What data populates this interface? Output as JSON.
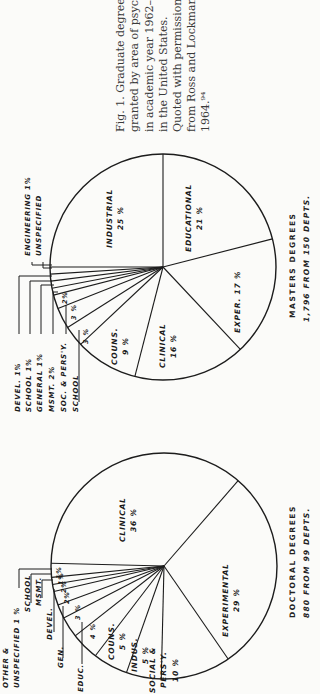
{
  "caption": {
    "lines": [
      "Fig. 1. Graduate degrees",
      "granted by area of psycho",
      "in academic year 1962–63",
      "in the United States.",
      "Quoted with permission",
      "from Ross and Lockman,",
      "1964.⁹⁴"
    ]
  },
  "masters": {
    "title": "MASTERS DEGREES",
    "subtitle": "1,796 FROM 150 DEPTS."
  },
  "doctoral": {
    "title": "DOCTORAL DEGREES",
    "subtitle": "880 FROM 99 DEPTS."
  },
  "chart_data": [
    {
      "type": "pie",
      "title": "MASTERS DEGREES",
      "subtitle": "1,796 FROM 150 DEPTS.",
      "orientation": "rotated -90deg (text reads bottom-to-top)",
      "center": [
        163,
        267
      ],
      "radius": 113,
      "start_angle_deg": -90,
      "slices": [
        {
          "label": "EDUCATIONAL",
          "value": 21,
          "display": "21 %",
          "inside": true
        },
        {
          "label": "EXPER.",
          "value": 17,
          "display": "17 %",
          "inside": true
        },
        {
          "label": "CLINICAL",
          "value": 16,
          "display": "16 %",
          "inside": true
        },
        {
          "label": "COUNS.",
          "value": 9,
          "display": "9 %",
          "inside": true
        },
        {
          "label": "SCHOOL",
          "value": 3,
          "display": "3 %",
          "inside": false
        },
        {
          "label": "SOC. & PERS'Y.",
          "value": 3,
          "display": "3 %",
          "inside": false
        },
        {
          "label": "MSMT.",
          "value": 2,
          "display": "2 %",
          "inside": false
        },
        {
          "label": "GENERAL",
          "value": 1,
          "display": "1 %",
          "inside": false
        },
        {
          "label": "SCHOOL",
          "value": 1,
          "display": "1 %",
          "inside": false
        },
        {
          "label": "DEVEL.",
          "value": 1,
          "display": "1 %",
          "inside": false
        },
        {
          "label": "ENGINEERING / UNSPECIFIED",
          "value": 1,
          "display": "1 %",
          "inside": false
        },
        {
          "label": "INDUSTRIAL",
          "value": 25,
          "display": "25 %",
          "inside": true
        }
      ],
      "outside_labels": [
        {
          "text": "ENGINEERING   1%",
          "x": 29,
          "y": 256
        },
        {
          "text": "UNSPECIFIED",
          "x": 40,
          "y": 256
        },
        {
          "text": "DEVEL.     1%",
          "x": 19,
          "y": 412
        },
        {
          "text": "SCHOOL     1%",
          "x": 30,
          "y": 412
        },
        {
          "text": "GENERAL    1%",
          "x": 41,
          "y": 412
        },
        {
          "text": "MSMT.      2%",
          "x": 53,
          "y": 412
        },
        {
          "text": "SOC. & PERS'Y.",
          "x": 65,
          "y": 412
        },
        {
          "text": "SCHOOL",
          "x": 77,
          "y": 412
        }
      ],
      "inner_labels": [
        {
          "text": "INDUSTRIAL",
          "sub": "25 %",
          "x": 117,
          "y": 218
        },
        {
          "text": "EDUCATIONAL",
          "sub": "21 %",
          "x": 196,
          "y": 218
        },
        {
          "text": "EXPER.  17 %",
          "sub": "",
          "x": 240,
          "y": 302
        },
        {
          "text": "CLINICAL",
          "sub": "16 %",
          "x": 170,
          "y": 346
        },
        {
          "text": "COUNS.",
          "sub": "9 %",
          "x": 122,
          "y": 346
        },
        {
          "text": "3 %",
          "sub": "",
          "x": 88,
          "y": 336
        },
        {
          "text": "3 %",
          "sub": "",
          "x": 76,
          "y": 312
        },
        {
          "text": "2%",
          "sub": "",
          "x": 67,
          "y": 298
        }
      ]
    },
    {
      "type": "pie",
      "title": "DOCTORAL DEGREES",
      "subtitle": "880 FROM 99 DEPTS.",
      "orientation": "rotated -90deg (text reads bottom-to-top)",
      "center": [
        164,
        566
      ],
      "radius": 113,
      "start_angle_deg": -49,
      "slices": [
        {
          "label": "EXPERIMENTAL",
          "value": 29,
          "display": "29 %",
          "inside": true
        },
        {
          "label": "SOCIAL & PERS'Y.",
          "value": 10,
          "display": "10 %",
          "inside": true
        },
        {
          "label": "INDUS.",
          "value": 5,
          "display": "5 %",
          "inside": true
        },
        {
          "label": "COUNS.",
          "value": 5,
          "display": "5 %",
          "inside": true
        },
        {
          "label": "EDUC.",
          "value": 4,
          "display": "4 %",
          "inside": false
        },
        {
          "label": "GEN.",
          "value": 3,
          "display": "3 %",
          "inside": false
        },
        {
          "label": "DEVEL.",
          "value": 2,
          "display": "2 %",
          "inside": false
        },
        {
          "label": "MSMT.",
          "value": 2,
          "display": "2 %",
          "inside": false
        },
        {
          "label": "SCHOOL",
          "value": 1,
          "display": "1 %",
          "inside": false
        },
        {
          "label": "OTHER & UNSPECIFIED",
          "value": 1,
          "display": "1 %",
          "inside": false
        },
        {
          "label": "",
          "value": 2,
          "display": "",
          "inside": false
        },
        {
          "label": "CLINICAL",
          "value": 36,
          "display": "36 %",
          "inside": true
        }
      ],
      "outside_labels": [
        {
          "text": "OTHER &",
          "x": 7,
          "y": 688
        },
        {
          "text": "UNSPECIFIED  1 %",
          "x": 18,
          "y": 688
        },
        {
          "text": "SCHOOL",
          "x": 29,
          "y": 612
        },
        {
          "text": "MSMT.",
          "x": 40,
          "y": 606
        },
        {
          "text": "DEVEL.",
          "x": 51,
          "y": 640
        },
        {
          "text": "GEN.",
          "x": 62,
          "y": 668
        },
        {
          "text": "EDUC.",
          "x": 82,
          "y": 692
        }
      ],
      "inner_labels": [
        {
          "text": "CLINICAL",
          "sub": "36 %",
          "x": 130,
          "y": 520
        },
        {
          "text": "EXPERIMENTAL",
          "sub": "29 %",
          "x": 233,
          "y": 600
        },
        {
          "text": "SOCIAL &",
          "sub": "PERS'Y.",
          "sub2": "10 %",
          "x": 166,
          "y": 670
        },
        {
          "text": "INDUS.",
          "sub": "5 %",
          "x": 142,
          "y": 655
        },
        {
          "text": "COUNS.",
          "sub": "5 %",
          "x": 119,
          "y": 641
        },
        {
          "text": "4 %",
          "sub": "",
          "x": 95,
          "y": 631
        },
        {
          "text": "3 %",
          "sub": "",
          "x": 80,
          "y": 612
        },
        {
          "text": "2%",
          "sub": "",
          "x": 69,
          "y": 598
        },
        {
          "text": "2%",
          "sub": "",
          "x": 66,
          "y": 587
        },
        {
          "text": "1%",
          "sub": "",
          "x": 63,
          "y": 579
        },
        {
          "text": "1%",
          "sub": "",
          "x": 61,
          "y": 573
        }
      ]
    }
  ]
}
